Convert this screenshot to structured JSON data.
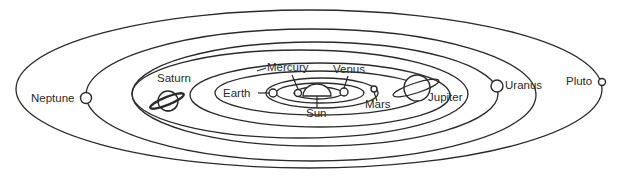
{
  "diagram": {
    "type": "solar-system",
    "labels": {
      "neptune": "Neptune",
      "saturn": "Saturn",
      "mercury": "Mercury",
      "venus": "Venus",
      "earth": "Earth",
      "sun": "Sun",
      "mars": "Mars",
      "jupiter": "Jupiter",
      "uranus": "Uranus",
      "pluto": "Pluto"
    },
    "colors": {
      "line": "#2a2a2a",
      "background": "#ffffff"
    }
  }
}
